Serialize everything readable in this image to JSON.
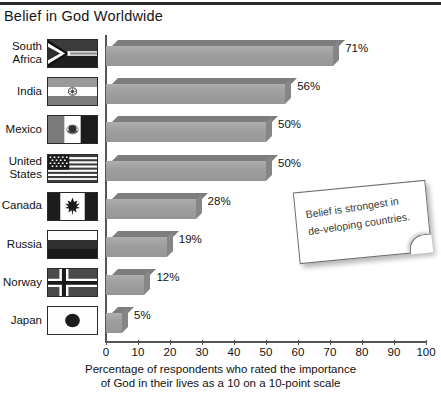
{
  "header": {
    "title": "Belief in God Worldwide"
  },
  "note": {
    "text": "Belief is strongest in de-veloping countries."
  },
  "axis": {
    "caption_line1": "Percentage of respondents who rated the importance",
    "caption_line2": "of God in their lives as a 10 on a 10-point scale",
    "ticks": [
      "0",
      "10",
      "20",
      "30",
      "40",
      "50",
      "60",
      "70",
      "80",
      "90",
      "100"
    ]
  },
  "chart_data": {
    "type": "bar",
    "orientation": "horizontal",
    "title": "Belief in God Worldwide",
    "xlabel": "Percentage of respondents who rated the importance of God in their lives as a 10 on a 10-point scale",
    "ylabel": "",
    "xlim": [
      0,
      100
    ],
    "xticks": [
      0,
      10,
      20,
      30,
      40,
      50,
      60,
      70,
      80,
      90,
      100
    ],
    "grid": false,
    "legend": "none",
    "bar_color": "#9e9e9e",
    "categories": [
      "South Africa",
      "India",
      "Mexico",
      "United States",
      "Canada",
      "Russia",
      "Norway",
      "Japan"
    ],
    "values": [
      71,
      56,
      50,
      50,
      28,
      19,
      12,
      5
    ],
    "value_labels": [
      "71%",
      "56%",
      "50%",
      "50%",
      "28%",
      "19%",
      "12%",
      "5%"
    ],
    "annotation": "Belief is strongest in developing countries."
  },
  "rows": [
    {
      "label_line1": "South",
      "label_line2": "Africa",
      "flag": "flag-south-africa",
      "value": 71,
      "value_label": "71%"
    },
    {
      "label_line1": "India",
      "label_line2": "",
      "flag": "flag-india",
      "value": 56,
      "value_label": "56%"
    },
    {
      "label_line1": "Mexico",
      "label_line2": "",
      "flag": "flag-mexico",
      "value": 50,
      "value_label": "50%"
    },
    {
      "label_line1": "United",
      "label_line2": "States",
      "flag": "flag-united-states",
      "value": 50,
      "value_label": "50%"
    },
    {
      "label_line1": "Canada",
      "label_line2": "",
      "flag": "flag-canada",
      "value": 28,
      "value_label": "28%"
    },
    {
      "label_line1": "Russia",
      "label_line2": "",
      "flag": "flag-russia",
      "value": 19,
      "value_label": "19%"
    },
    {
      "label_line1": "Norway",
      "label_line2": "",
      "flag": "flag-norway",
      "value": 12,
      "value_label": "12%"
    },
    {
      "label_line1": "Japan",
      "label_line2": "",
      "flag": "flag-japan",
      "value": 5,
      "value_label": "5%"
    }
  ]
}
